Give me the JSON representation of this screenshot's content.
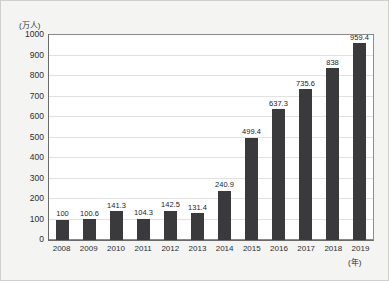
{
  "chart_data": {
    "type": "bar",
    "title": "",
    "subtitle": "",
    "xlabel": "(年)",
    "ylabel": "(万人)",
    "categories": [
      "2008",
      "2009",
      "2010",
      "2011",
      "2012",
      "2013",
      "2014",
      "2015",
      "2016",
      "2017",
      "2018",
      "2019"
    ],
    "values": [
      100,
      100.6,
      141.3,
      104.3,
      142.5,
      131.4,
      240.9,
      499.4,
      637.3,
      735.6,
      838,
      959.4
    ],
    "value_labels": [
      "100",
      "100.6",
      "141.3",
      "104.3",
      "142.5",
      "131.4",
      "240.9",
      "499.4",
      "637.3",
      "735.6",
      "838",
      "959.4"
    ],
    "ylim": [
      0,
      1000
    ],
    "yticks": [
      0,
      100,
      200,
      300,
      400,
      500,
      600,
      700,
      800,
      900,
      1000
    ],
    "ytick_labels": [
      "0",
      "100",
      "200",
      "300",
      "400",
      "500",
      "600",
      "700",
      "800",
      "900",
      "1000"
    ],
    "grid": true,
    "legend": null,
    "legend_position": "none",
    "series": [
      {
        "name": "",
        "values": [
          100,
          100.6,
          141.3,
          104.3,
          142.5,
          131.4,
          240.9,
          499.4,
          637.3,
          735.6,
          838,
          959.4
        ],
        "color": "#3a3a3c"
      }
    ],
    "colors": {
      "bar": "#3a3a3c",
      "grid": "#e2e2e2",
      "axis": "#6a6a6a",
      "plot_background": "#ffffff",
      "figure_background": "#f4f4f2",
      "text": "#2e2e33"
    }
  }
}
